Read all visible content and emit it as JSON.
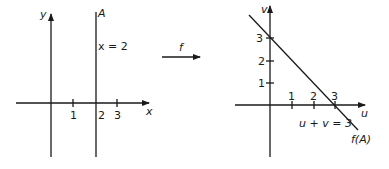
{
  "diagram": {
    "left_plot": {
      "x_axis_label": "x",
      "y_axis_label": "y",
      "x_ticks": [
        "1",
        "2",
        "3"
      ],
      "line_name": "A",
      "line_equation": "x = 2"
    },
    "mapping": {
      "label": "f"
    },
    "right_plot": {
      "u_axis_label": "u",
      "v_axis_label": "v",
      "u_ticks": [
        "1",
        "2",
        "3"
      ],
      "v_ticks": [
        "1",
        "2",
        "3"
      ],
      "line_equation": "u + v = 3",
      "line_name": "f(A)"
    },
    "colors": {
      "ink": "#1a1a1a",
      "background": "#ffffff"
    }
  }
}
